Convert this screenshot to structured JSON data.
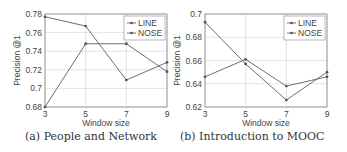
{
  "chart_data": [
    {
      "type": "line",
      "title": "",
      "caption": "(a) People and Network",
      "xlabel": "Window size",
      "ylabel": "Precision @1",
      "x": [
        3,
        5,
        7,
        9
      ],
      "x_ticks": [
        "3",
        "5",
        "7",
        "9"
      ],
      "y_ticks": [
        "0.68",
        "0.7",
        "0.72",
        "0.74",
        "0.76",
        "0.78"
      ],
      "y_tick_values": [
        0.68,
        0.7,
        0.72,
        0.74,
        0.76,
        0.78
      ],
      "ylim": [
        0.68,
        0.78
      ],
      "xlim": [
        3,
        9
      ],
      "grid": true,
      "legend_position": "upper right",
      "series": [
        {
          "name": "LINE",
          "values": [
            0.68,
            0.748,
            0.748,
            0.718
          ]
        },
        {
          "name": "NOSE",
          "values": [
            0.777,
            0.767,
            0.709,
            0.728
          ]
        }
      ]
    },
    {
      "type": "line",
      "title": "",
      "caption": "(b) Introduction to MOOC",
      "xlabel": "Window size",
      "ylabel": "Precision @1",
      "x": [
        3,
        5,
        7,
        9
      ],
      "x_ticks": [
        "3",
        "5",
        "7",
        "9"
      ],
      "y_ticks": [
        "0.62",
        "0.64",
        "0.66",
        "0.68",
        "0.7"
      ],
      "y_tick_values": [
        0.62,
        0.64,
        0.66,
        0.68,
        0.7
      ],
      "ylim": [
        0.62,
        0.7
      ],
      "xlim": [
        3,
        9
      ],
      "grid": true,
      "legend_position": "upper right",
      "series": [
        {
          "name": "LINE",
          "values": [
            0.646,
            0.661,
            0.638,
            0.646
          ]
        },
        {
          "name": "NOSE",
          "values": [
            0.693,
            0.657,
            0.626,
            0.65
          ]
        }
      ]
    }
  ],
  "colors": {
    "line": "#6e6e6e",
    "grid": "#d0d0d0",
    "axis": "#888888",
    "text": "#444444"
  }
}
